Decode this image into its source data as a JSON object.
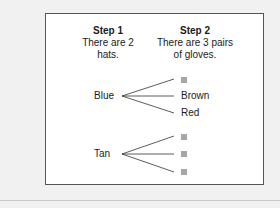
{
  "step1": {
    "title": "Step 1",
    "line1": "There are 2",
    "line2": "hats."
  },
  "step2": {
    "title": "Step 2",
    "line1": "There are 3 pairs",
    "line2": "of gloves."
  },
  "tree": [
    {
      "hat": "Blue",
      "gloves": [
        "",
        "Brown",
        "Red"
      ]
    },
    {
      "hat": "Tan",
      "gloves": [
        "",
        "",
        ""
      ]
    }
  ],
  "colors": {
    "blank_square": "#a6a6a6",
    "border": "#555555",
    "background": "#f1f1f1"
  }
}
